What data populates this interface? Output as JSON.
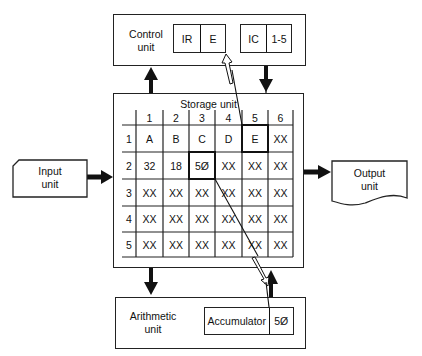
{
  "control_unit": {
    "label": "Control\nunit",
    "label_line1": "Control",
    "label_line2": "unit",
    "instruction_register": {
      "name": "IR",
      "value": "E"
    },
    "instruction_counter": {
      "name": "IC",
      "value": "1-5"
    }
  },
  "storage_unit": {
    "title": "Storage unit",
    "columns": [
      "1",
      "2",
      "3",
      "4",
      "5",
      "6"
    ],
    "rows": [
      {
        "label": "1",
        "cells": [
          "A",
          "B",
          "C",
          "D",
          "E",
          "XX"
        ]
      },
      {
        "label": "2",
        "cells": [
          "32",
          "18",
          "5Ø",
          "XX",
          "XX",
          "XX"
        ]
      },
      {
        "label": "3",
        "cells": [
          "XX",
          "XX",
          "XX",
          "XX",
          "XX",
          "XX"
        ]
      },
      {
        "label": "4",
        "cells": [
          "XX",
          "XX",
          "XX",
          "XX",
          "XX",
          "XX"
        ]
      },
      {
        "label": "5",
        "cells": [
          "XX",
          "XX",
          "XX",
          "XX",
          "XX",
          "XX"
        ]
      }
    ],
    "highlighted_cells": [
      {
        "row": "1",
        "col": "5",
        "value": "E"
      },
      {
        "row": "2",
        "col": "3",
        "value": "5Ø"
      }
    ]
  },
  "input_unit": {
    "line1": "Input",
    "line2": "unit"
  },
  "output_unit": {
    "line1": "Output",
    "line2": "unit"
  },
  "arithmetic_unit": {
    "line1": "Arithmetic",
    "line2": "unit",
    "accumulator": {
      "name": "Accumulator",
      "value": "5Ø"
    }
  }
}
